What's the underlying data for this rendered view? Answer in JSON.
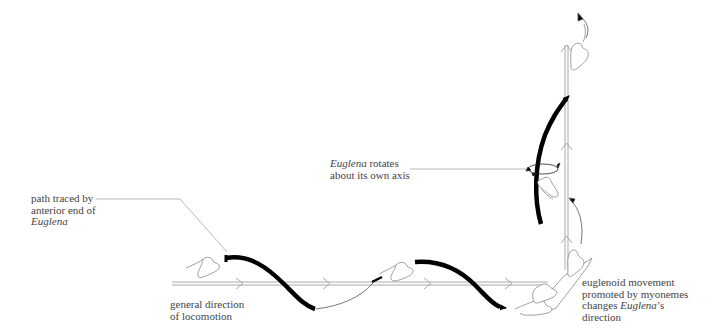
{
  "diagram": {
    "labels": {
      "path_traced": {
        "line1": "path traced by",
        "line2": "anterior end of",
        "line3_italic": "Euglena"
      },
      "general_direction": {
        "line1": "general direction",
        "line2": "of locomotion"
      },
      "rotates": {
        "line1_italic": "Euglena",
        "line1_rest": " rotates",
        "line2": "about its own axis"
      },
      "euglenoid": {
        "line1": "euglenoid movement",
        "line2": "promoted by myonemes",
        "line3_pre": "changes ",
        "line3_italic": "Euglena",
        "line3_post": "’s",
        "line4": "direction"
      }
    },
    "colors": {
      "line": "#999999",
      "thick_path": "#000000",
      "text": "#444444",
      "outline": "#777777"
    }
  }
}
